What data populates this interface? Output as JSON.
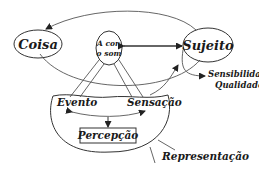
{
  "diagram": {
    "nodes": {
      "coisa": "Coisa",
      "sujeito": "Sujeito",
      "center_line1": "A cor,",
      "center_line2": "o som",
      "evento": "Evento",
      "sensacao": "Sensação",
      "percepcao": "Percepção",
      "sensibilidades": "Sensibilidades",
      "qualidades": "Qualidades",
      "representacao": "Representação"
    },
    "colors": {
      "line": "#555555",
      "text": "#1a1a1a",
      "background": "#ffffff"
    }
  }
}
